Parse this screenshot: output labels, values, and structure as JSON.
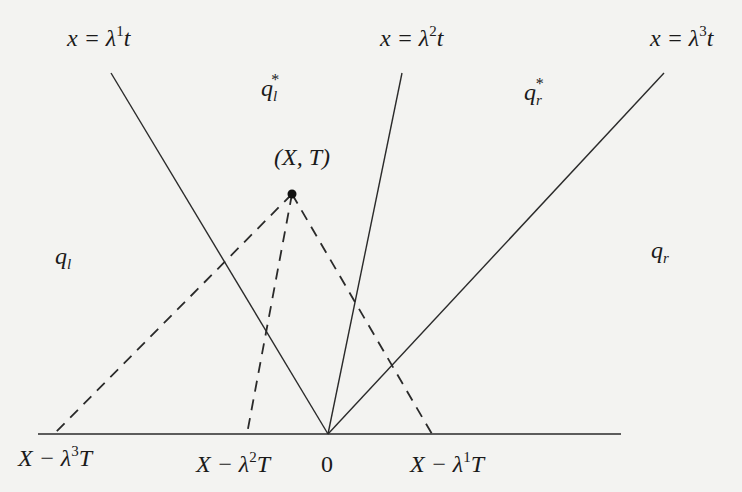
{
  "diagram": {
    "type": "characteristic-fan diagram (x–t plane)",
    "colors": {
      "line": "#2a2a2a",
      "background": "#f3f3f1",
      "point": "#111111"
    },
    "axis": {
      "x1": 38,
      "x2": 621,
      "y": 434
    },
    "origin": {
      "x": 328,
      "y": 434,
      "label": "0"
    },
    "point": {
      "x": 292,
      "y": 194,
      "label": "(X, T)"
    },
    "solid_lines": [
      {
        "id": "lambda1",
        "label_lhs": "x = λ",
        "sup": "1",
        "label_rhs": "t",
        "from": [
          328,
          434
        ],
        "to": [
          111,
          73
        ]
      },
      {
        "id": "lambda2",
        "label_lhs": "x = λ",
        "sup": "2",
        "label_rhs": "t",
        "from": [
          328,
          434
        ],
        "to": [
          402,
          73
        ]
      },
      {
        "id": "lambda3",
        "label_lhs": "x = λ",
        "sup": "3",
        "label_rhs": "t",
        "from": [
          328,
          434
        ],
        "to": [
          664,
          73
        ]
      }
    ],
    "dashed_lines": [
      {
        "id": "back-lambda3",
        "from": [
          292,
          194
        ],
        "to": [
          54,
          434
        ]
      },
      {
        "id": "back-lambda2",
        "from": [
          292,
          194
        ],
        "to": [
          247,
          434
        ]
      },
      {
        "id": "back-lambda1",
        "from": [
          292,
          194
        ],
        "to": [
          432,
          434
        ]
      }
    ],
    "state_labels": {
      "q_l": {
        "base": "q",
        "sub": "l"
      },
      "q_l_star": {
        "base": "q",
        "sub": "l",
        "sup": "*"
      },
      "q_r_star": {
        "base": "q",
        "sub": "r",
        "sup": "*"
      },
      "q_r": {
        "base": "q",
        "sub": "r"
      }
    },
    "foot_labels": {
      "x_minus_l3": {
        "lhs": "X − λ",
        "sup": "3",
        "rhs": "T"
      },
      "x_minus_l2": {
        "lhs": "X − λ",
        "sup": "2",
        "rhs": "T"
      },
      "zero": "0",
      "x_minus_l1": {
        "lhs": "X − λ",
        "sup": "1",
        "rhs": "T"
      }
    }
  }
}
